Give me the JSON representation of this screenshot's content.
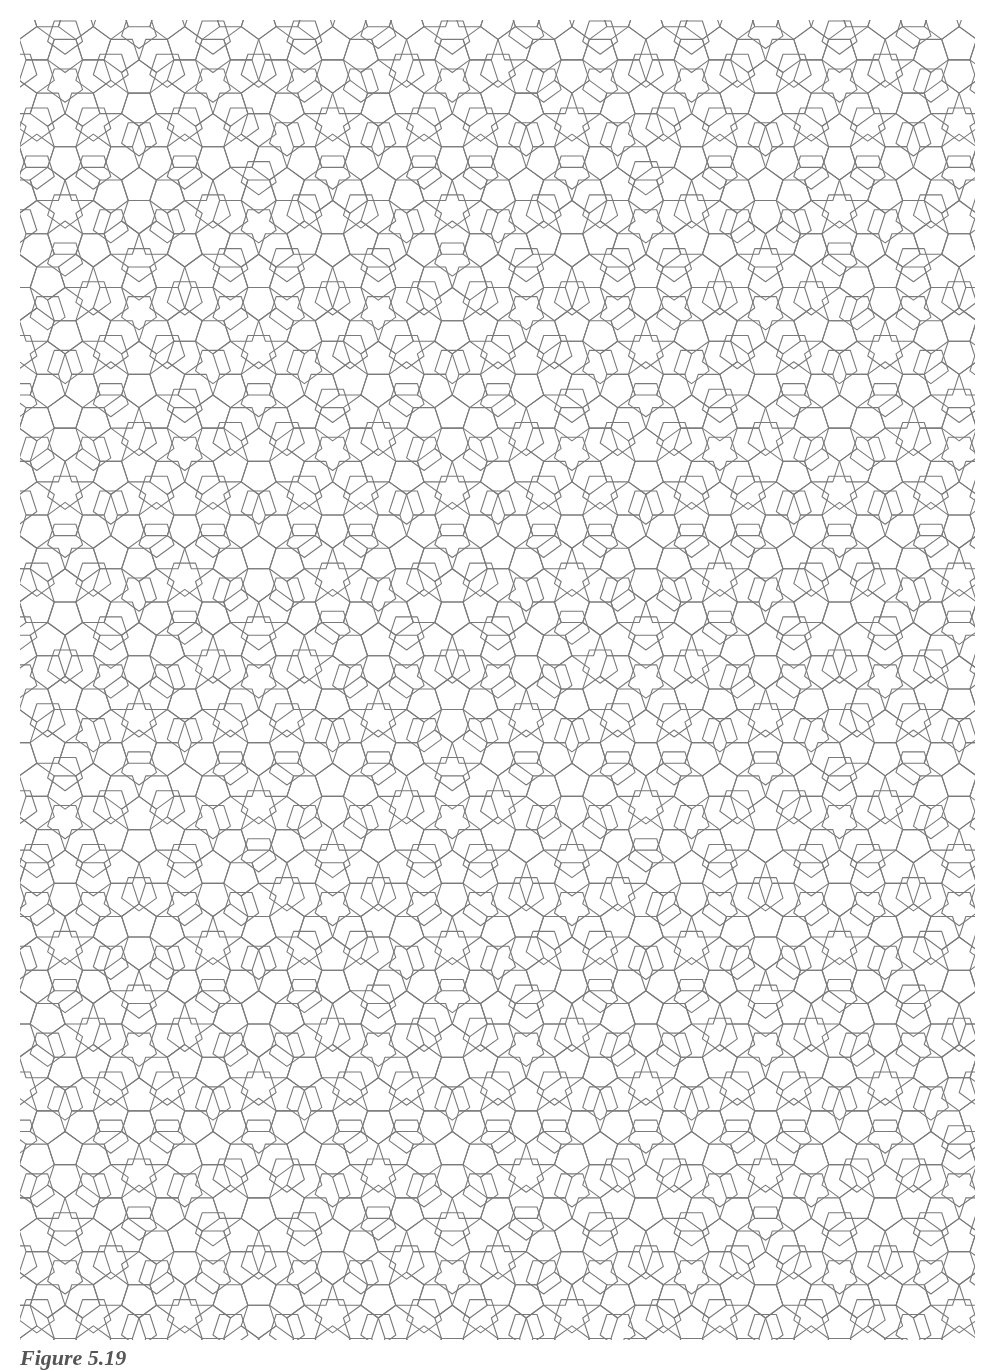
{
  "figure": {
    "caption": "Figure 5.19",
    "tiles": [
      "pentagon",
      "decagon",
      "pentagram"
    ],
    "line_color": "#7a7a7a",
    "background": "#ffffff",
    "clip": {
      "x": 20,
      "y": 20,
      "width": 955,
      "height": 1320
    }
  }
}
